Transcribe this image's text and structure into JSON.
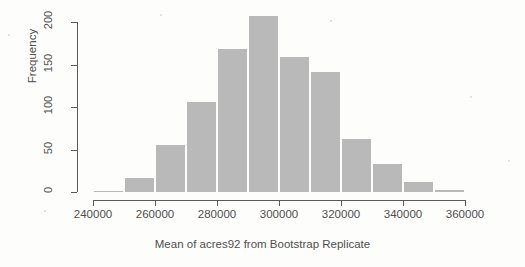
{
  "chart_data": {
    "type": "bar",
    "title": "",
    "xlabel": "Mean of acres92 from Bootstrap Replicate",
    "ylabel": "Frequency",
    "xlim": [
      240000,
      360000
    ],
    "ylim": [
      0,
      208
    ],
    "grid": false,
    "legend": "none",
    "bin_width": 10000,
    "x_ticks": [
      240000,
      260000,
      280000,
      300000,
      320000,
      340000,
      360000
    ],
    "x_tick_labels": [
      "240000",
      "260000",
      "280000",
      "300000",
      "320000",
      "340000",
      "360000"
    ],
    "y_ticks": [
      0,
      50,
      100,
      150,
      200
    ],
    "y_tick_labels": [
      "0",
      "50",
      "100",
      "150",
      "200"
    ],
    "bin_edges": [
      240000,
      250000,
      260000,
      270000,
      280000,
      290000,
      300000,
      310000,
      320000,
      330000,
      340000,
      350000,
      360000
    ],
    "categories": [
      "240000-250000",
      "250000-260000",
      "260000-270000",
      "270000-280000",
      "280000-290000",
      "290000-300000",
      "300000-310000",
      "310000-320000",
      "320000-330000",
      "330000-340000",
      "340000-350000",
      "350000-360000"
    ],
    "values": [
      2,
      18,
      56,
      107,
      170,
      208,
      160,
      142,
      63,
      34,
      13,
      4
    ],
    "bar_color": "#b9b9b9",
    "axis_color": "#5a5a5a",
    "text_color": "#4f4f4f",
    "background": "#fdfdfc"
  }
}
